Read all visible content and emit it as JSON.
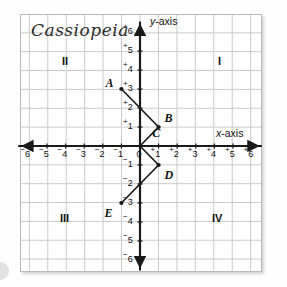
{
  "title": "Cassiopeia",
  "axes": {
    "y_label_var": "y",
    "y_label_suffix": "-axis",
    "x_label_var": "x",
    "x_label_suffix": "-axis"
  },
  "quadrants": [
    {
      "name": "quadrant-1",
      "label": "I"
    },
    {
      "name": "quadrant-2",
      "label": "II"
    },
    {
      "name": "quadrant-3",
      "label": "III"
    },
    {
      "name": "quadrant-4",
      "label": "IV"
    }
  ],
  "x_ticks": [
    {
      "value": -6,
      "sign": "−",
      "digit": "6"
    },
    {
      "value": -5,
      "sign": "−",
      "digit": "5"
    },
    {
      "value": -4,
      "sign": "−",
      "digit": "4"
    },
    {
      "value": -3,
      "sign": "−",
      "digit": "3"
    },
    {
      "value": -2,
      "sign": "−",
      "digit": "2"
    },
    {
      "value": -1,
      "sign": "−",
      "digit": "1"
    },
    {
      "value": 0,
      "sign": "",
      "digit": "0"
    },
    {
      "value": 1,
      "sign": "+",
      "digit": "1"
    },
    {
      "value": 2,
      "sign": "+",
      "digit": "2"
    },
    {
      "value": 3,
      "sign": "+",
      "digit": "3"
    },
    {
      "value": 4,
      "sign": "+",
      "digit": "4"
    },
    {
      "value": 5,
      "sign": "+",
      "digit": "5"
    },
    {
      "value": 6,
      "sign": "+",
      "digit": "6"
    }
  ],
  "y_ticks": [
    {
      "value": 6,
      "sign": "+",
      "digit": "6"
    },
    {
      "value": 5,
      "sign": "+",
      "digit": "5"
    },
    {
      "value": 4,
      "sign": "+",
      "digit": "4"
    },
    {
      "value": 3,
      "sign": "+",
      "digit": "3"
    },
    {
      "value": 2,
      "sign": "+",
      "digit": "2"
    },
    {
      "value": 1,
      "sign": "+",
      "digit": "1"
    },
    {
      "value": -1,
      "sign": "−",
      "digit": "1"
    },
    {
      "value": -2,
      "sign": "−",
      "digit": "2"
    },
    {
      "value": -3,
      "sign": "−",
      "digit": "3"
    },
    {
      "value": -4,
      "sign": "−",
      "digit": "4"
    },
    {
      "value": -5,
      "sign": "−",
      "digit": "5"
    },
    {
      "value": -6,
      "sign": "−",
      "digit": "6"
    }
  ],
  "points": [
    {
      "label": "A",
      "x": -1,
      "y": 3,
      "label_dx": -16,
      "label_dy": -13
    },
    {
      "label": "B",
      "x": 1,
      "y": 1,
      "label_dx": 6,
      "label_dy": -16
    },
    {
      "label": "C",
      "x": 0.55,
      "y": 0.35,
      "label_dx": 2,
      "label_dy": -13
    },
    {
      "label": "D",
      "x": 1,
      "y": -1,
      "label_dx": 6,
      "label_dy": 3
    },
    {
      "label": "E",
      "x": -1,
      "y": -3,
      "label_dx": -17,
      "label_dy": 3
    }
  ],
  "polyline": [
    {
      "x": -1,
      "y": 3
    },
    {
      "x": 1,
      "y": 1
    },
    {
      "x": 0,
      "y": 0
    },
    {
      "x": 1,
      "y": -1
    },
    {
      "x": -1,
      "y": -3
    }
  ],
  "grid": {
    "min": -6.5,
    "max": 6.5,
    "cell_color": "#c9c9c9",
    "axis_color": "#1a1a1a",
    "line_color": "#1a1a1a",
    "dot_color": "#1a1a1a"
  }
}
